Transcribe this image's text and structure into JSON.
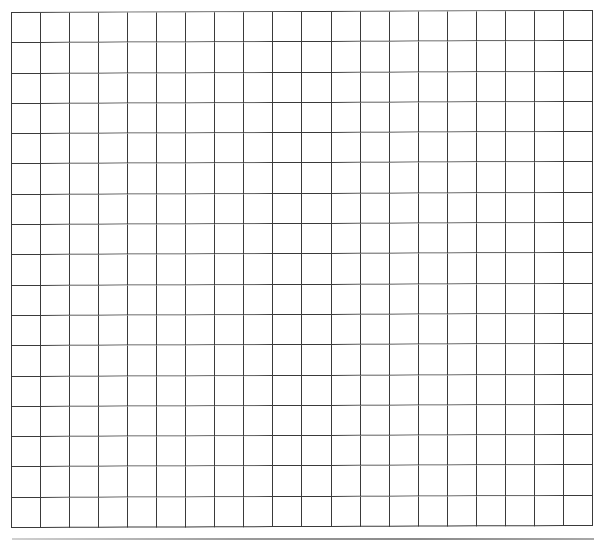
{
  "grid": {
    "columns": 20,
    "rows": 17,
    "line_color": "#3a3a3a",
    "background_color": "#ffffff",
    "cells": []
  },
  "page": {
    "bottom_edge_color": "#9a9a9a"
  }
}
